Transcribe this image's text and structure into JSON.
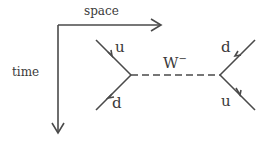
{
  "diagram": {
    "type": "feynman",
    "axes": {
      "x_label": "space",
      "y_label": "time"
    },
    "boson": {
      "label": "W",
      "charge": "−"
    },
    "left_vertex": {
      "incoming": "u",
      "outgoing": "d"
    },
    "right_vertex": {
      "incoming": "d",
      "outgoing": "u"
    },
    "colors": {
      "line": "#4a4a4a",
      "text": "#3a3a3a",
      "background": "#ffffff"
    }
  }
}
